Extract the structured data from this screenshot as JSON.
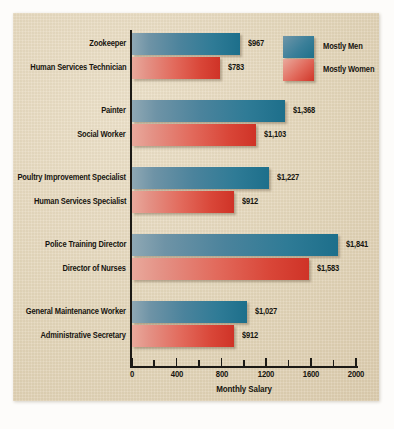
{
  "chart_data": {
    "type": "bar",
    "orientation": "horizontal",
    "title": "",
    "xlabel": "Monthly Salary",
    "ylabel": "",
    "xlim": [
      0,
      2000
    ],
    "xticks": [
      0,
      400,
      800,
      1200,
      1600,
      2000
    ],
    "xtick_labels": [
      "0",
      "400",
      "800",
      "1200",
      "1600",
      "2000"
    ],
    "minor_tick_step": 200,
    "grid": false,
    "legend_position": "top-right",
    "legend": [
      {
        "name": "Mostly Men",
        "color": "#2f7b96"
      },
      {
        "name": "Mostly Women",
        "color": "#d94638"
      }
    ],
    "groups": [
      {
        "bars": [
          {
            "category": "Zookeeper",
            "series": "Mostly Men",
            "value": 967,
            "label": "$967"
          },
          {
            "category": "Human Services Technician",
            "series": "Mostly Women",
            "value": 783,
            "label": "$783"
          }
        ]
      },
      {
        "bars": [
          {
            "category": "Painter",
            "series": "Mostly Men",
            "value": 1368,
            "label": "$1,368"
          },
          {
            "category": "Social Worker",
            "series": "Mostly Women",
            "value": 1103,
            "label": "$1,103"
          }
        ]
      },
      {
        "bars": [
          {
            "category": "Poultry Improvement Specialist",
            "series": "Mostly Men",
            "value": 1227,
            "label": "$1,227"
          },
          {
            "category": "Human Services Specialist",
            "series": "Mostly Women",
            "value": 912,
            "label": "$912"
          }
        ]
      },
      {
        "bars": [
          {
            "category": "Police Training Director",
            "series": "Mostly Men",
            "value": 1841,
            "label": "$1,841"
          },
          {
            "category": "Director of Nurses",
            "series": "Mostly Women",
            "value": 1583,
            "label": "$1,583"
          }
        ]
      },
      {
        "bars": [
          {
            "category": "General Maintenance Worker",
            "series": "Mostly Men",
            "value": 1027,
            "label": "$1,027"
          },
          {
            "category": "Administrative Secretary",
            "series": "Mostly Women",
            "value": 912,
            "label": "$912"
          }
        ]
      }
    ],
    "categories": [
      "Zookeeper",
      "Human Services Technician",
      "Painter",
      "Social Worker",
      "Poultry Improvement Specialist",
      "Human Services Specialist",
      "Police Training Director",
      "Director of Nurses",
      "General Maintenance Worker",
      "Administrative Secretary"
    ],
    "values": [
      967,
      783,
      1368,
      1103,
      1227,
      912,
      1841,
      1583,
      1027,
      912
    ],
    "colors": {
      "men": "#2f7b96",
      "women": "#d94638",
      "background": "#e4d6bb",
      "text": "#17150f",
      "axis": "#1c1a16"
    }
  }
}
